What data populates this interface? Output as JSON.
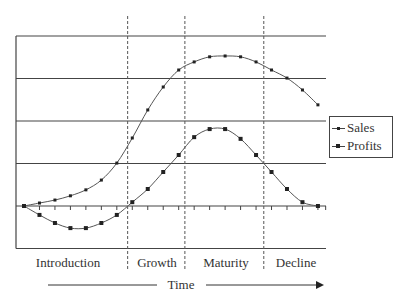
{
  "chart_data": {
    "type": "line",
    "title": "",
    "xlabel": "Time",
    "ylabel": "",
    "x": [
      0,
      1,
      2,
      3,
      4,
      5,
      6,
      7,
      8,
      9,
      10,
      11,
      12,
      13,
      14,
      15,
      16,
      17,
      18,
      19
    ],
    "series": [
      {
        "name": "Sales",
        "marker": "small-square",
        "values": [
          0,
          0.07,
          0.14,
          0.24,
          0.38,
          0.61,
          1.01,
          1.6,
          2.26,
          2.8,
          3.2,
          3.39,
          3.51,
          3.53,
          3.51,
          3.39,
          3.2,
          3.01,
          2.73,
          2.38
        ]
      },
      {
        "name": "Profits",
        "marker": "square",
        "values": [
          0,
          -0.21,
          -0.4,
          -0.52,
          -0.52,
          -0.4,
          -0.21,
          0.09,
          0.4,
          0.8,
          1.2,
          1.62,
          1.81,
          1.81,
          1.58,
          1.2,
          0.8,
          0.4,
          0.09,
          0
        ]
      }
    ],
    "ylim": [
      -1,
      4
    ],
    "gridlines_y": [
      -1,
      1,
      2,
      3,
      4
    ],
    "zero_axis_with_ticks": true,
    "grid": true,
    "legend_position": "right",
    "stages": [
      {
        "label": "Introduction",
        "x_start": -0.5,
        "x_end": 6.7
      },
      {
        "label": "Growth",
        "x_start": 6.7,
        "x_end": 10.4
      },
      {
        "label": "Maturity",
        "x_start": 10.4,
        "x_end": 15.5
      },
      {
        "label": "Decline",
        "x_start": 15.5,
        "x_end": 19.5
      }
    ],
    "stage_boundaries_x": [
      6.7,
      10.4,
      15.5
    ],
    "annotations": [
      "Time →"
    ]
  },
  "legend": {
    "items": [
      {
        "label": "Sales"
      },
      {
        "label": "Profits"
      }
    ]
  },
  "stages": [
    "Introduction",
    "Growth",
    "Maturity",
    "Decline"
  ],
  "axis": {
    "time_label": "Time"
  }
}
